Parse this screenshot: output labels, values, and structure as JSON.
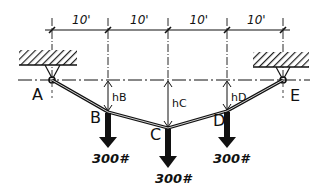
{
  "diagram": {
    "type": "cable with point loads",
    "spans": [
      "10'",
      "10'",
      "10'",
      "10'"
    ],
    "points": [
      {
        "id": "A",
        "label": "A",
        "role": "left support"
      },
      {
        "id": "B",
        "label": "B",
        "role": "load point"
      },
      {
        "id": "C",
        "label": "C",
        "role": "load point"
      },
      {
        "id": "D",
        "label": "D",
        "role": "load point"
      },
      {
        "id": "E",
        "label": "E",
        "role": "right support"
      }
    ],
    "sags": [
      {
        "at": "B",
        "label": "hB"
      },
      {
        "at": "C",
        "label": "hC"
      },
      {
        "at": "D",
        "label": "hD"
      }
    ],
    "loads": [
      {
        "at": "B",
        "label": "300#"
      },
      {
        "at": "C",
        "label": "300#"
      },
      {
        "at": "D",
        "label": "300#"
      }
    ],
    "colors": {
      "ink": "#111111",
      "background": "#ffffff"
    }
  }
}
